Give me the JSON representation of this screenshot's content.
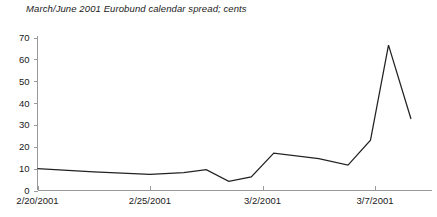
{
  "chart_data": {
    "type": "line",
    "title": "March/June 2001 Eurobund calendar spread; cents",
    "xlabel": "",
    "ylabel": "",
    "grid": false,
    "legend": "none",
    "ylim": [
      0,
      70
    ],
    "yticks": [
      0,
      10,
      20,
      30,
      40,
      50,
      60,
      70
    ],
    "ytick_labels": [
      "0",
      "10",
      "20",
      "30",
      "40",
      "50",
      "60",
      "70"
    ],
    "xtick_labels": [
      "2/20/2001",
      "2/25/2001",
      "3/2/2001",
      "3/7/2001"
    ],
    "xtick_positions": [
      0,
      5,
      10,
      15
    ],
    "xlim": [
      0,
      16.6
    ],
    "series": [
      {
        "name": "March/June 2001 Eurobund calendar spread",
        "color": "#222222",
        "x": [
          0,
          2.5,
          5,
          6.5,
          7.5,
          8.5,
          9.5,
          10.5,
          12.5,
          13.8,
          14.8,
          15.6,
          16.6
        ],
        "values": [
          10,
          8.5,
          7.4,
          8.2,
          9.5,
          4.2,
          6.2,
          17.1,
          14.6,
          11.6,
          23.0,
          66.5,
          32.7
        ]
      }
    ]
  }
}
